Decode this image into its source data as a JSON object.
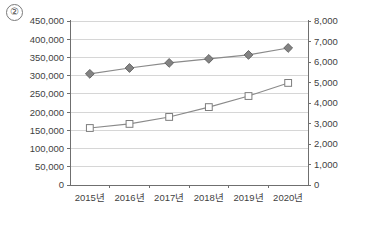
{
  "figure": {
    "badge_label": "②"
  },
  "chart_data": {
    "type": "line",
    "title": "",
    "subtitle": "",
    "xlabel": "",
    "ylabel": "",
    "grid": true,
    "legend_position": "none",
    "categories": [
      "2015년",
      "2016년",
      "2017년",
      "2018년",
      "2019년",
      "2020년"
    ],
    "axes": {
      "left": {
        "min": 0,
        "max": 450000,
        "step": 50000,
        "tick_labels": [
          "0",
          "50,000",
          "100,000",
          "150,000",
          "200,000",
          "250,000",
          "300,000",
          "350,000",
          "400,000",
          "450,000"
        ],
        "tick_values": [
          0,
          50000,
          100000,
          150000,
          200000,
          250000,
          300000,
          350000,
          400000,
          450000
        ]
      },
      "right": {
        "min": 0,
        "max": 8000,
        "step": 1000,
        "tick_labels": [
          "0",
          "1,000",
          "2,000",
          "3,000",
          "4,000",
          "5,000",
          "6,000",
          "7,000",
          "8,000"
        ],
        "tick_values": [
          0,
          1000,
          2000,
          3000,
          4000,
          5000,
          6000,
          7000,
          8000
        ]
      }
    },
    "series": [
      {
        "name": "series-diamond",
        "axis": "left",
        "marker": "diamond",
        "color": "#838383",
        "values": [
          305000,
          321000,
          335000,
          346000,
          357000,
          376000
        ]
      },
      {
        "name": "series-square",
        "axis": "right",
        "marker": "square",
        "color": "#7d7d7d",
        "values": [
          2780,
          2980,
          3320,
          3800,
          4340,
          4980
        ]
      }
    ]
  }
}
